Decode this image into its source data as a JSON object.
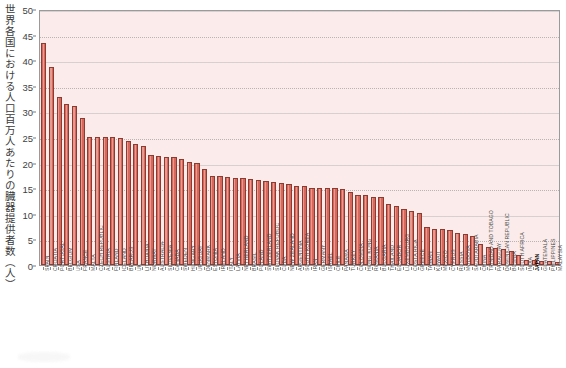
{
  "chart_data": {
    "type": "bar",
    "title": "",
    "subtitle": "",
    "xlabel": "",
    "ylabel": "世界各国における人口百万人あたりの臓器提供者数（人）",
    "ylim": [
      0,
      50
    ],
    "ytick_values": [
      0,
      5,
      10,
      15,
      20,
      25,
      30,
      35,
      40,
      45,
      50
    ],
    "ytick_labels": [
      "0",
      "5",
      "10",
      "15",
      "20",
      "25",
      "30",
      "35",
      "40",
      "45",
      "50"
    ],
    "grid": true,
    "grid_axis": "y",
    "legend": "none",
    "bar_color": "#d9685c",
    "bar_edge_color": "#8d3a31",
    "plot_background": "#fbeceb",
    "highlight_category": "JAPAN",
    "categories": [
      "SPAIN",
      "CROATIA",
      "PORTUGAL",
      "BELGIUM",
      "USA",
      "FRANCE",
      "MALTA",
      "CZECH REPUBLIC",
      "AUSTRIA",
      "FINLAND",
      "ICELAND",
      "BELARUS",
      "UK",
      "LITHUANIA",
      "NORWAY",
      "AUSTRALIA",
      "SLOVENIA",
      "CANADA",
      "SWEDEN",
      "HUNGARY",
      "URUGUAY",
      "DENMARK",
      "ESTONIA",
      "IRELAND",
      "ITALY",
      "LATVIA",
      "NETHERLAND",
      "BRASIL",
      "POLAND",
      "SWITZERLAND",
      "SLOVAK REPUBLIC",
      "CUBA",
      "NEW ZEALAND",
      "ARGENTINA",
      "SOUTH KOREA",
      "IRAN",
      "GERMANY",
      "ISRAEL",
      "CHILE",
      "PANAMA",
      "TURKEY",
      "COLOMBIA",
      "HONG KONG",
      "ROMANIA",
      "BULGARIA",
      "THAILAND",
      "ECUADOR",
      "LUXEMBOURG",
      "COSTA RICA",
      "GREECE",
      "TAIWAN",
      "KUWAIT",
      "MEXICO",
      "CYPRUS",
      "RUSSIA",
      "MOLDOVA",
      "SAUDI ARABIA",
      "CHINA",
      "TRINIDAD AND TOBAGO",
      "PARAGUAY",
      "DOMINICAN REPUBLIC",
      "BOSNIA",
      "SOUTH AFRICA",
      "INDIA",
      "JAPAN",
      "GUATEMALA",
      "PHILIPPINES",
      "MALAYSIA"
    ],
    "values": [
      43.4,
      38.6,
      32.9,
      31.4,
      31.0,
      28.7,
      25.1,
      25.1,
      25.1,
      25.0,
      24.9,
      24.2,
      23.6,
      23.2,
      21.5,
      21.2,
      21.1,
      21.0,
      20.7,
      20.1,
      20.0,
      18.8,
      17.4,
      17.4,
      17.1,
      17.0,
      16.9,
      16.8,
      16.6,
      16.5,
      16.2,
      16.0,
      15.8,
      15.5,
      15.4,
      15.1,
      15.1,
      15.1,
      15.0,
      14.9,
      14.3,
      13.6,
      13.6,
      13.3,
      13.2,
      12.0,
      11.6,
      11.0,
      10.5,
      10.1,
      7.4,
      7.0,
      7.0,
      6.9,
      6.2,
      6.1,
      5.6,
      4.1,
      3.5,
      3.3,
      3.2,
      2.8,
      2.0,
      1.0,
      0.9,
      0.8,
      0.7,
      0.6
    ]
  },
  "axes": {
    "y_axis_name": "y-axis",
    "x_axis_name": "x-axis"
  }
}
